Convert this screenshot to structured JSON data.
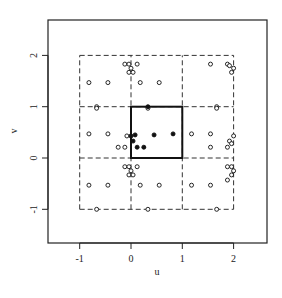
{
  "chart_data": {
    "type": "scatter",
    "title": "",
    "xlabel": "u",
    "ylabel": "v",
    "xlim": [
      -1.62,
      2.63
    ],
    "ylim": [
      -1.66,
      2.67
    ],
    "x_ticks": [
      -1,
      0,
      1,
      2
    ],
    "y_ticks": [
      -1,
      0,
      1,
      2
    ],
    "x_tick_labels": [
      "-1",
      "0",
      "1",
      "2"
    ],
    "y_tick_labels": [
      "-1",
      "0",
      "1",
      "2"
    ],
    "grid": false,
    "unit_square": {
      "x0": 0,
      "y0": 0,
      "x1": 1,
      "y1": 1,
      "style": "solid"
    },
    "dashed_grid": {
      "x_lines": [
        -1,
        0,
        1,
        2
      ],
      "y_lines": [
        -1,
        0,
        1,
        2
      ],
      "style": "dashed"
    },
    "series": [
      {
        "name": "original (filled)",
        "marker": "filled-circle",
        "points": [
          [
            0.33,
            1.0
          ],
          [
            0.0,
            0.43
          ],
          [
            0.08,
            0.45
          ],
          [
            0.04,
            0.33
          ],
          [
            0.12,
            0.21
          ],
          [
            0.25,
            0.21
          ],
          [
            0.45,
            0.45
          ],
          [
            0.82,
            0.47
          ]
        ]
      },
      {
        "name": "periodic images (open)",
        "marker": "open-circle",
        "points": [
          [
            -0.82,
            1.47
          ],
          [
            -0.45,
            1.47
          ],
          [
            0.18,
            1.47
          ],
          [
            0.55,
            1.47
          ],
          [
            -0.82,
            0.47
          ],
          [
            -0.45,
            0.47
          ],
          [
            1.18,
            0.47
          ],
          [
            1.55,
            0.47
          ],
          [
            -0.82,
            -0.53
          ],
          [
            -0.45,
            -0.53
          ],
          [
            0.18,
            -0.53
          ],
          [
            0.55,
            -0.53
          ],
          [
            1.18,
            -0.53
          ],
          [
            1.55,
            -0.53
          ],
          [
            -0.67,
            -1.0
          ],
          [
            0.33,
            -1.0
          ],
          [
            1.67,
            -1.0
          ],
          [
            -0.67,
            1.0
          ],
          [
            -0.67,
            0.97
          ],
          [
            0.33,
            0.97
          ],
          [
            1.67,
            1.0
          ],
          [
            1.67,
            0.97
          ],
          [
            -0.12,
            1.83
          ],
          [
            -0.04,
            1.83
          ],
          [
            0.12,
            1.83
          ],
          [
            0.0,
            1.75
          ],
          [
            -0.04,
            1.67
          ],
          [
            0.04,
            1.67
          ],
          [
            1.55,
            1.83
          ],
          [
            1.88,
            1.83
          ],
          [
            2.0,
            1.75
          ],
          [
            1.96,
            1.67
          ],
          [
            1.92,
            1.8
          ],
          [
            -0.12,
            0.21
          ],
          [
            -0.25,
            0.21
          ],
          [
            -0.08,
            0.43
          ],
          [
            1.55,
            0.21
          ],
          [
            1.88,
            0.21
          ],
          [
            1.92,
            0.33
          ],
          [
            2.0,
            0.43
          ],
          [
            1.96,
            0.28
          ],
          [
            -0.12,
            -0.17
          ],
          [
            -0.04,
            -0.17
          ],
          [
            0.12,
            -0.17
          ],
          [
            -0.04,
            -0.33
          ],
          [
            0.04,
            -0.33
          ],
          [
            0.0,
            -0.25
          ],
          [
            1.88,
            -0.17
          ],
          [
            1.96,
            -0.17
          ],
          [
            2.0,
            -0.25
          ],
          [
            1.96,
            -0.33
          ],
          [
            1.88,
            -0.43
          ]
        ]
      }
    ]
  },
  "axes": {
    "x_label": "u",
    "y_label": "v"
  }
}
